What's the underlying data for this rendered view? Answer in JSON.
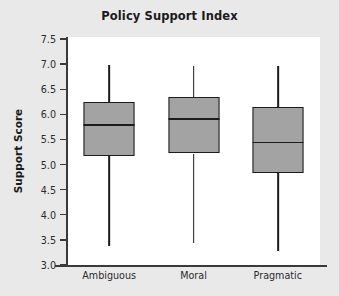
{
  "chart_data": {
    "type": "box",
    "title": "Policy Support Index",
    "xlabel": "",
    "ylabel": "Support Score",
    "categories": [
      "Ambiguous",
      "Moral",
      "Pragmatic"
    ],
    "ylim": [
      3.0,
      7.5
    ],
    "ytick_labels": [
      "7.5",
      "7.0",
      "6.5",
      "6.0",
      "5.5",
      "5.0",
      "4.5",
      "4.0",
      "3.5",
      "3.0"
    ],
    "ytick_values": [
      7.5,
      7.0,
      6.5,
      6.0,
      5.5,
      5.0,
      4.5,
      4.0,
      3.5,
      3.0
    ],
    "grid": false,
    "legend": "none",
    "box_fill_color": "#a3a3a3",
    "box_line_color": "#1c1c1c",
    "plot_background": "#ffffff",
    "figure_background": "#e9e9e9",
    "boxes": [
      {
        "category": "Ambiguous",
        "whisker_low": 3.37,
        "q1": 5.17,
        "median": 5.78,
        "q3": 6.25,
        "whisker_high": 6.98
      },
      {
        "category": "Moral",
        "whisker_low": 3.43,
        "q1": 5.22,
        "median": 5.91,
        "q3": 6.34,
        "whisker_high": 6.97
      },
      {
        "category": "Pragmatic",
        "whisker_low": 3.28,
        "q1": 4.83,
        "median": 5.44,
        "q3": 6.14,
        "whisker_high": 6.97
      }
    ]
  }
}
